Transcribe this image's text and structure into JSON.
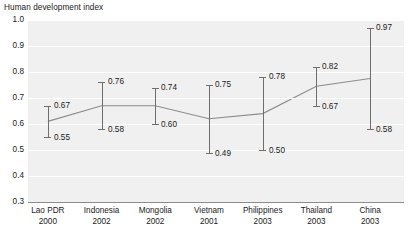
{
  "chart_data": {
    "type": "bar",
    "title": "Human development index",
    "xlabel": "",
    "ylabel": "",
    "ylim": [
      0.3,
      1.0
    ],
    "yticks": [
      "1.0",
      "0.9",
      "0.8",
      "0.7",
      "0.6",
      "0.5",
      "0.4",
      "0.3"
    ],
    "grid": true,
    "legend": "none",
    "categories": [
      "Lao PDR",
      "Indonesia",
      "Mongolia",
      "Vietnam",
      "Philippines",
      "Thailand",
      "China"
    ],
    "years": [
      "2000",
      "2002",
      "2002",
      "2001",
      "2003",
      "2003",
      "2003"
    ],
    "series": [
      {
        "name": "low",
        "values": [
          0.55,
          0.58,
          0.6,
          0.49,
          0.5,
          0.67,
          0.58
        ]
      },
      {
        "name": "high",
        "values": [
          0.67,
          0.76,
          0.74,
          0.75,
          0.78,
          0.82,
          0.97
        ]
      }
    ],
    "low_labels": [
      "0.55",
      "0.58",
      "0.60",
      "0.49",
      "0.50",
      "0.67",
      "0.58"
    ],
    "high_labels": [
      "0.67",
      "0.76",
      "0.74",
      "0.75",
      "0.78",
      "0.82",
      "0.97"
    ],
    "midpoints": [
      0.61,
      0.67,
      0.67,
      0.62,
      0.64,
      0.745,
      0.775
    ],
    "colors": {
      "plot_background": "#f0f0f0",
      "gridline": "#ffffff",
      "errorbar": "#6e6e6e",
      "trendline": "#8c8c8c",
      "axis": "#8c8c8c",
      "text": "#1a1a1a"
    }
  }
}
